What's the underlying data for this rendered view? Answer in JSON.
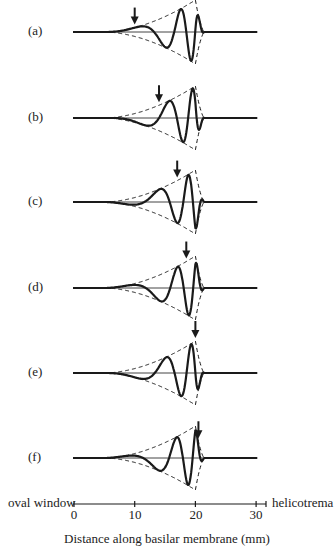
{
  "chart_data": {
    "type": "line",
    "title": "",
    "xlabel": "Distance along basilar membrane  (mm)",
    "ylabel": "",
    "xlim": [
      0,
      32
    ],
    "x_ticks": [
      0,
      10,
      20,
      30
    ],
    "axis_left_label": "oval window",
    "axis_right_label": "helicotrema",
    "envelope": {
      "style": "dashed",
      "start_mm": 5,
      "peak_mm": 20,
      "end_mm": 21.5,
      "peak_amplitude": 1.0
    },
    "panels": [
      {
        "label": "(a)",
        "arrow_mm": 10,
        "phase_deg": 0
      },
      {
        "label": "(b)",
        "arrow_mm": 14,
        "phase_deg": 90
      },
      {
        "label": "(c)",
        "arrow_mm": 17,
        "phase_deg": 180
      },
      {
        "label": "(d)",
        "arrow_mm": 18.5,
        "phase_deg": 225
      },
      {
        "label": "(e)",
        "arrow_mm": 20,
        "phase_deg": 270
      },
      {
        "label": "(f)",
        "arrow_mm": 20.5,
        "phase_deg": 315
      }
    ],
    "legend": "none",
    "grid": false
  },
  "axis": {
    "left_label": "oval window",
    "right_label": "helicotrema",
    "ticks": [
      "0",
      "10",
      "20",
      "30"
    ],
    "xlabel": "Distance along basilar membrane  (mm)"
  },
  "panels": {
    "a": "(a)",
    "b": "(b)",
    "c": "(c)",
    "d": "(d)",
    "e": "(e)",
    "f": "(f)"
  },
  "colors": {
    "ink": "#1a1a1a",
    "baseline": "#444444",
    "background": "#ffffff"
  }
}
